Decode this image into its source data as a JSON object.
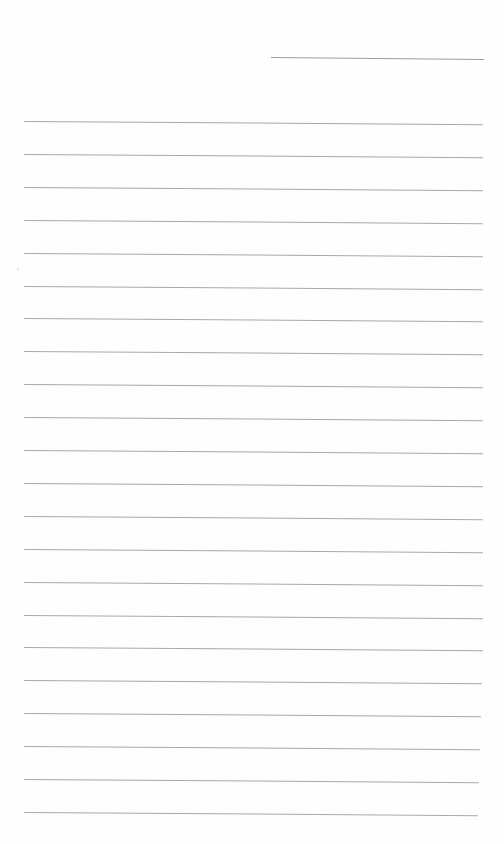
{
  "page": {
    "type": "lined-writing-sheet",
    "background": "#ffffff",
    "rule_color": "#a9a9a9",
    "header_line": {
      "x": 271,
      "y": 57,
      "width": 213
    },
    "rules": {
      "count": 22,
      "first_y": 121,
      "spacing": 32.9,
      "left_x": 24,
      "right_x": 483
    },
    "text": []
  }
}
